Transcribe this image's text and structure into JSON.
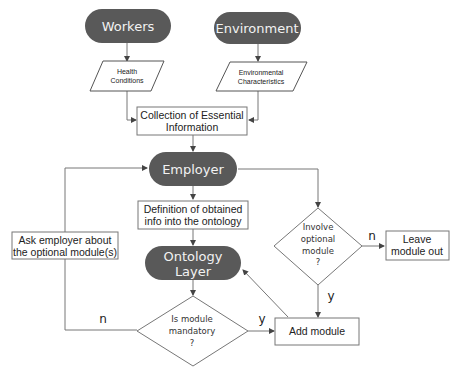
{
  "diagram": {
    "type": "flowchart",
    "colors": {
      "terminal_fill": "#595959",
      "terminal_text": "#f2f2f2",
      "stroke": "#777777",
      "background": "#ffffff"
    },
    "nodes": {
      "workers": {
        "shape": "terminal",
        "label": "Workers"
      },
      "environment": {
        "shape": "terminal",
        "label": "Environment"
      },
      "health_conditions": {
        "shape": "parallelogram",
        "line1": "Health",
        "line2": "Conditions"
      },
      "environmental_characteristics": {
        "shape": "parallelogram",
        "line1": "Environmental",
        "line2": "Characteristics"
      },
      "collection": {
        "shape": "process",
        "line1": "Collection of Essential",
        "line2": "Information"
      },
      "employer": {
        "shape": "terminal",
        "label": "Employer"
      },
      "definition": {
        "shape": "process",
        "line1": "Definition of obtained",
        "line2": "info into the ontology"
      },
      "ontology_layer": {
        "shape": "terminal",
        "line1": "Ontology",
        "line2": "Layer"
      },
      "involve_optional": {
        "shape": "decision",
        "line1": "Involve",
        "line2": "optional",
        "line3": "module",
        "line4": "?"
      },
      "leave_module_out": {
        "shape": "process",
        "line1": "Leave",
        "line2": "module out"
      },
      "ask_employer": {
        "shape": "process",
        "line1": "Ask employer about",
        "line2": "the optional module(s)"
      },
      "is_mandatory": {
        "shape": "decision",
        "line1": "Is module",
        "line2": "mandatory",
        "line3": "?"
      },
      "add_module": {
        "shape": "process",
        "label": "Add module"
      }
    },
    "edge_labels": {
      "involve_no": "n",
      "involve_yes": "y",
      "mandatory_no": "n",
      "mandatory_yes": "y"
    },
    "edges": [
      {
        "from": "Workers",
        "to": "Health Conditions"
      },
      {
        "from": "Environment",
        "to": "Environmental Characteristics"
      },
      {
        "from": "Health Conditions",
        "to": "Collection of Essential Information"
      },
      {
        "from": "Environmental Characteristics",
        "to": "Collection of Essential Information"
      },
      {
        "from": "Collection of Essential Information",
        "to": "Employer"
      },
      {
        "from": "Employer",
        "to": "Definition of obtained info into the ontology"
      },
      {
        "from": "Employer",
        "to": "Involve optional module ?"
      },
      {
        "from": "Definition of obtained info into the ontology",
        "to": "Ontology Layer"
      },
      {
        "from": "Involve optional module ?",
        "to": "Leave module out",
        "label": "n"
      },
      {
        "from": "Involve optional module ?",
        "to": "Add module",
        "label": "y"
      },
      {
        "from": "Ontology Layer",
        "to": "Is module mandatory ?"
      },
      {
        "from": "Is module mandatory ?",
        "to": "Add module",
        "label": "y"
      },
      {
        "from": "Is module mandatory ?",
        "to": "Ask employer about the optional module(s)",
        "label": "n"
      },
      {
        "from": "Ask employer about the optional module(s)",
        "to": "Employer"
      },
      {
        "from": "Add module",
        "to": "Ontology Layer"
      }
    ]
  }
}
